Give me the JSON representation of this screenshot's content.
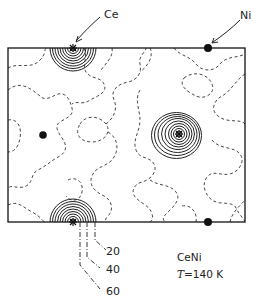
{
  "diagram": {
    "labels": {
      "ce": "Ce",
      "ni": "Ni",
      "compound": "CeNi",
      "temperature_symbol": "T",
      "temperature_value": "=140 K"
    },
    "contour_levels": [
      "20",
      "40",
      "60"
    ],
    "colors": {
      "line": "#222222",
      "background": "#ffffff"
    }
  }
}
